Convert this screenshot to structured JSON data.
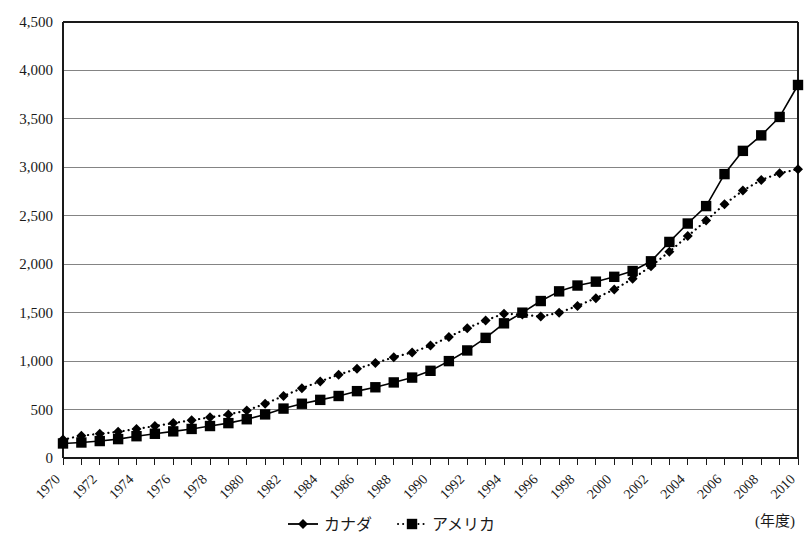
{
  "chart_data": {
    "type": "line",
    "title": "",
    "xlabel": "(年度)",
    "ylabel": "",
    "ylim": [
      0,
      4500
    ],
    "ytick_step": 500,
    "yticks": [
      "0",
      "500",
      "1,000",
      "1,500",
      "2,000",
      "2,500",
      "3,000",
      "3,500",
      "4,000",
      "4,500"
    ],
    "grid": true,
    "grid_axis": "y",
    "xlim": [
      1970,
      2010
    ],
    "x": [
      1970,
      1971,
      1972,
      1973,
      1974,
      1975,
      1976,
      1977,
      1978,
      1979,
      1980,
      1981,
      1982,
      1983,
      1984,
      1985,
      1986,
      1987,
      1988,
      1989,
      1990,
      1991,
      1992,
      1993,
      1994,
      1995,
      1996,
      1997,
      1998,
      1999,
      2000,
      2001,
      2002,
      2003,
      2004,
      2005,
      2006,
      2007,
      2008,
      2009,
      2010
    ],
    "xticks_labeled": [
      "1970",
      "1972",
      "1974",
      "1976",
      "1978",
      "1980",
      "1982",
      "1984",
      "1986",
      "1988",
      "1990",
      "1992",
      "1994",
      "1996",
      "1998",
      "2000",
      "2002",
      "2004",
      "2006",
      "2008",
      "2010"
    ],
    "xtick_every": 1,
    "xtick_label_every": 2,
    "xtick_label_rotation": -45,
    "legend_position": "bottom-center",
    "series": [
      {
        "name": "カナダ",
        "marker": "diamond",
        "line_style": "dotted",
        "color": "#000000",
        "values": [
          190,
          230,
          250,
          270,
          300,
          330,
          360,
          390,
          420,
          450,
          490,
          560,
          640,
          720,
          790,
          860,
          920,
          980,
          1040,
          1090,
          1160,
          1250,
          1340,
          1420,
          1490,
          1480,
          1460,
          1500,
          1570,
          1650,
          1740,
          1850,
          1980,
          2130,
          2290,
          2450,
          2620,
          2760,
          2870,
          2940,
          2980
        ]
      },
      {
        "name": "アメリカ",
        "marker": "square",
        "line_style": "solid",
        "color": "#000000",
        "values": [
          150,
          160,
          175,
          195,
          225,
          250,
          275,
          300,
          330,
          360,
          400,
          450,
          510,
          560,
          600,
          640,
          690,
          730,
          780,
          830,
          900,
          1000,
          1110,
          1240,
          1390,
          1500,
          1620,
          1720,
          1780,
          1820,
          1870,
          1930,
          2030,
          2230,
          2420,
          2600,
          2930,
          3170,
          3330,
          3520,
          3850
        ]
      }
    ]
  },
  "legend": {
    "items": [
      {
        "label": "カナダ",
        "marker": "diamond",
        "style": "solid-line-marker"
      },
      {
        "label": "アメリカ",
        "marker": "square",
        "style": "dotted-line-marker"
      }
    ]
  },
  "axis_note": "(年度)"
}
